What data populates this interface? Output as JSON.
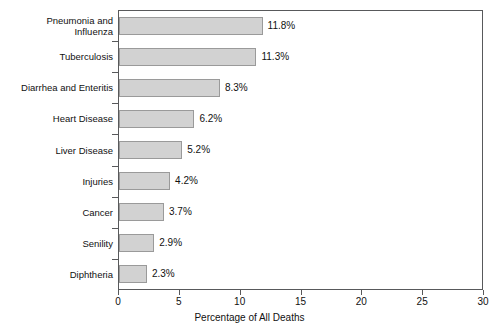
{
  "chart_data": {
    "type": "bar",
    "orientation": "horizontal",
    "title": "",
    "xlabel": "Percentage of All Deaths",
    "ylabel": "",
    "xlim": [
      0,
      30
    ],
    "xticks": [
      "0",
      "5",
      "10",
      "15",
      "20",
      "25",
      "30"
    ],
    "grid": false,
    "legend": null,
    "categories": [
      "Pneumonia and\nInfluenza",
      "Tuberculosis",
      "Diarrhea and Enteritis",
      "Heart Disease",
      "Liver Disease",
      "Injuries",
      "Cancer",
      "Senility",
      "Diphtheria"
    ],
    "values": [
      11.8,
      11.3,
      8.3,
      6.2,
      5.2,
      4.2,
      3.7,
      2.9,
      2.3
    ],
    "value_labels": [
      "11.8%",
      "11.3%",
      "8.3%",
      "6.2%",
      "5.2%",
      "4.2%",
      "3.7%",
      "2.9%",
      "2.3%"
    ],
    "colors": {
      "bar_fill": "#d2d2d2",
      "bar_border": "#9a9a9a",
      "axis": "#58595b",
      "text": "#111111",
      "background": "#ffffff"
    }
  }
}
